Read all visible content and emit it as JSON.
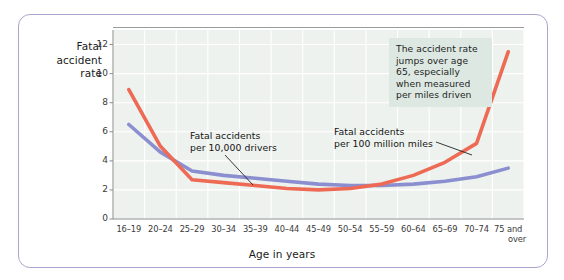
{
  "figure": {
    "border_color": "#a9a5cf",
    "background": "#ffffff"
  },
  "chart_data": {
    "type": "line",
    "title": "",
    "ylabel": "Fatal accident rate",
    "xlabel": "Age in years",
    "categories": [
      "16–19",
      "20–24",
      "25–29",
      "30–34",
      "35–39",
      "40–44",
      "45–49",
      "50–54",
      "55–59",
      "60–64",
      "65–69",
      "70–74",
      "75 and over"
    ],
    "yticks": [
      0,
      2,
      4,
      6,
      8,
      10,
      12
    ],
    "ylim": [
      0,
      13
    ],
    "grid": true,
    "legend_position": "inline-annotations",
    "plot_background": "#eef2ee",
    "gridline_color": "#ffffff",
    "series": [
      {
        "name": "Fatal accidents per 100 million miles",
        "color": "#ed6a55",
        "values": [
          8.9,
          5.0,
          2.7,
          2.5,
          2.3,
          2.1,
          2.0,
          2.1,
          2.4,
          3.0,
          3.9,
          5.2,
          11.5
        ]
      },
      {
        "name": "Fatal accidents per 10,000 drivers",
        "color": "#8b8fd0",
        "values": [
          6.5,
          4.6,
          3.3,
          3.0,
          2.8,
          2.6,
          2.4,
          2.3,
          2.3,
          2.4,
          2.6,
          2.9,
          3.5
        ]
      }
    ],
    "annotations": [
      {
        "id": "callout-age-65",
        "text": "The accident rate jumps over age 65, especially when measured per miles driven",
        "background": "#dde8e2"
      },
      {
        "id": "note-per-drivers",
        "text": "Fatal accidents\nper 10,000 drivers",
        "points_to": "Fatal accidents per 10,000 drivers"
      },
      {
        "id": "note-per-miles",
        "text": "Fatal accidents\nper 100 million miles",
        "points_to": "Fatal accidents per 100 million miles"
      }
    ]
  },
  "axis": {
    "y_title_lines": [
      "Fatal",
      "accident",
      "rate"
    ],
    "y_tick_labels": [
      "12",
      "10",
      "8",
      "6",
      "4",
      "2",
      "0"
    ],
    "x_tick_labels": [
      "16–19",
      "20–24",
      "25–29",
      "30–34",
      "35–39",
      "40–44",
      "45–49",
      "50–54",
      "55–59",
      "60–64",
      "65–69",
      "70–74",
      "75 and\nover"
    ],
    "x_title": "Age in years"
  }
}
